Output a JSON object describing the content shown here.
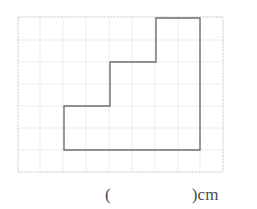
{
  "worksheet": {
    "title": "Grid Figure Perimeter Question",
    "answer": {
      "open_paren": "(",
      "blank_value": "",
      "close_paren_with_unit": ")cm",
      "unit": "cm"
    }
  },
  "grid": {
    "cell_size": 22,
    "origin_x": 18,
    "origin_y": 17,
    "columns": 9,
    "rows": 7,
    "boundary_color": "#cfcfcf",
    "line_color": "#eceaea",
    "boundary_style": "dotted",
    "left": 18,
    "top": 17,
    "right": 223,
    "bottom": 172
  },
  "figure": {
    "name": "staircase-polygon",
    "stroke_color": "#6e6e6e",
    "fill": "none",
    "stroke_width": 1.4,
    "vertices": [
      {
        "x": 64,
        "y": 106
      },
      {
        "x": 110,
        "y": 106
      },
      {
        "x": 110,
        "y": 62
      },
      {
        "x": 156,
        "y": 62
      },
      {
        "x": 156,
        "y": 18
      },
      {
        "x": 200,
        "y": 18
      },
      {
        "x": 200,
        "y": 150
      },
      {
        "x": 64,
        "y": 150
      }
    ],
    "points_attr": "64,106 110,106 110,62 156,62 156,18 200,18 200,150 64,150"
  }
}
